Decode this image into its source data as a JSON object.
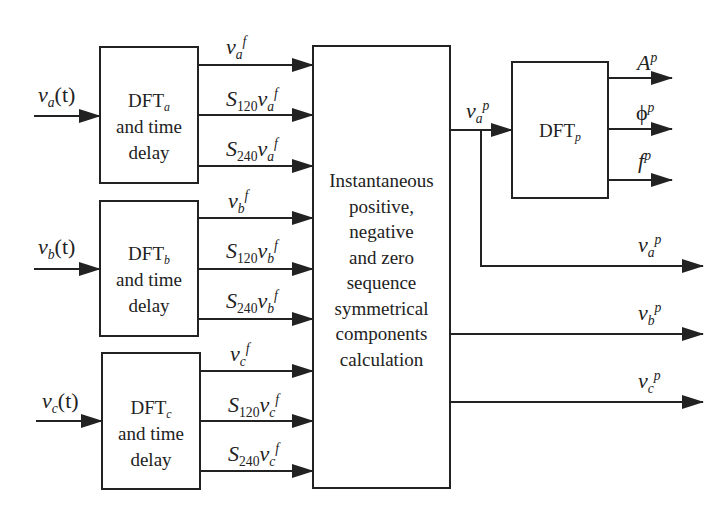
{
  "diagram": {
    "inputs": [
      {
        "var": "v",
        "sub": "a",
        "arg": "(t)"
      },
      {
        "var": "v",
        "sub": "b",
        "arg": "(t)"
      },
      {
        "var": "v",
        "sub": "c",
        "arg": "(t)"
      }
    ],
    "dft_blocks": [
      {
        "name": "DFT",
        "sub": "a",
        "line2": "and time",
        "line3": "delay"
      },
      {
        "name": "DFT",
        "sub": "b",
        "line2": "and time",
        "line3": "delay"
      },
      {
        "name": "DFT",
        "sub": "c",
        "line2": "and time",
        "line3": "delay"
      }
    ],
    "block_outputs": [
      [
        {
          "prefix": "",
          "prefix_sub": "",
          "var": "v",
          "sub": "a",
          "sup": "f"
        },
        {
          "prefix": "S",
          "prefix_sub": "120",
          "var": "v",
          "sub": "a",
          "sup": "f"
        },
        {
          "prefix": "S",
          "prefix_sub": "240",
          "var": "v",
          "sub": "a",
          "sup": "f"
        }
      ],
      [
        {
          "prefix": "",
          "prefix_sub": "",
          "var": "v",
          "sub": "b",
          "sup": "f"
        },
        {
          "prefix": "S",
          "prefix_sub": "120",
          "var": "v",
          "sub": "b",
          "sup": "f"
        },
        {
          "prefix": "S",
          "prefix_sub": "240",
          "var": "v",
          "sub": "b",
          "sup": "f"
        }
      ],
      [
        {
          "prefix": "",
          "prefix_sub": "",
          "var": "v",
          "sub": "c",
          "sup": "f"
        },
        {
          "prefix": "S",
          "prefix_sub": "120",
          "var": "v",
          "sub": "c",
          "sup": "f"
        },
        {
          "prefix": "S",
          "prefix_sub": "240",
          "var": "v",
          "sub": "c",
          "sup": "f"
        }
      ]
    ],
    "central_block": {
      "lines": [
        "Instantaneous",
        "positive,",
        "negative",
        "and zero",
        "sequence",
        "symmetrical",
        "components",
        "calculation"
      ]
    },
    "dftp_block": {
      "name": "DFT",
      "sub": "p"
    },
    "dftp_input": {
      "var": "v",
      "sub": "a",
      "sup": "p"
    },
    "dftp_outputs": [
      {
        "sym": "A",
        "sup": "p"
      },
      {
        "sym": "ϕ",
        "sup": "p"
      },
      {
        "sym": "f",
        "sup": "p"
      }
    ],
    "final_outputs": [
      {
        "var": "v",
        "sub": "a",
        "sup": "p"
      },
      {
        "var": "v",
        "sub": "b",
        "sup": "p"
      },
      {
        "var": "v",
        "sub": "c",
        "sup": "p"
      }
    ],
    "colors": {
      "line": "#222222",
      "background": "#ffffff"
    }
  }
}
